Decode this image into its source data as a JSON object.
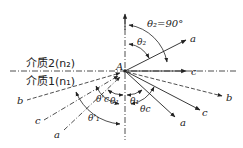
{
  "diagram": {
    "type": "optics-refraction-total-internal-reflection",
    "interface_point": "A",
    "media": {
      "upper": {
        "label": "介质2(n₂)",
        "name": "介质2",
        "index": "n₂"
      },
      "lower": {
        "label": "介质1(n₁)",
        "name": "介质1",
        "index": "n₁"
      }
    },
    "angle_labels": {
      "refraction_max": "θ₂=90°",
      "refraction": "θ₂",
      "incidence": "θ₁",
      "reflection": "θ₁",
      "critical": "θc",
      "critical_incident": "θ'c",
      "incident_beyond": "θ'₁"
    },
    "ray_labels": {
      "a_incident": "a",
      "a_refracted": "a",
      "a_reflected": "a",
      "b_incident": "b",
      "b_reflected": "b",
      "c_incident": "c",
      "c_refracted": "c",
      "c_reflected": "c"
    },
    "point_label": "A"
  }
}
